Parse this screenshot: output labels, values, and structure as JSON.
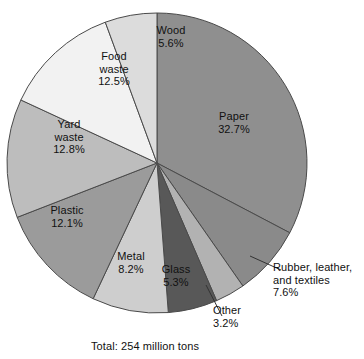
{
  "chart_data": {
    "type": "pie",
    "title": "",
    "subtitle": "",
    "caption": "Total: 254 million tons",
    "total_label": "Total: 254 million tons",
    "total_value": 254,
    "total_units": "million tons",
    "units": "percent",
    "start_angle_deg": 0,
    "direction": "clockwise",
    "legend": "none",
    "grid": false,
    "categories": [
      "Paper",
      "Rubber, leather, and textiles",
      "Other",
      "Glass",
      "Metal",
      "Plastic",
      "Yard waste",
      "Food waste",
      "Wood"
    ],
    "values": [
      32.7,
      7.6,
      3.2,
      5.3,
      8.2,
      12.1,
      12.8,
      12.5,
      5.6
    ],
    "slices": [
      {
        "key": "paper",
        "name": "Paper",
        "value": 32.7,
        "value_label": "32.7%",
        "color": "#8f8f8f",
        "label_placement": "inside",
        "label_lines": [
          "Paper",
          "32.7%"
        ]
      },
      {
        "key": "rubber",
        "name": "Rubber, leather, and textiles",
        "value": 7.6,
        "value_label": "7.6%",
        "color": "#8a8a8a",
        "label_placement": "callout",
        "label_lines": [
          "Rubber, leather,",
          "and textiles",
          "7.6%"
        ]
      },
      {
        "key": "other",
        "name": "Other",
        "value": 3.2,
        "value_label": "3.2%",
        "color": "#b2b2b2",
        "label_placement": "callout",
        "label_lines": [
          "Other",
          "3.2%"
        ]
      },
      {
        "key": "glass",
        "name": "Glass",
        "value": 5.3,
        "value_label": "5.3%",
        "color": "#585858",
        "label_placement": "inside",
        "label_lines": [
          "Glass",
          "5.3%"
        ]
      },
      {
        "key": "metal",
        "name": "Metal",
        "value": 8.2,
        "value_label": "8.2%",
        "color": "#cecece",
        "label_placement": "inside",
        "label_lines": [
          "Metal",
          "8.2%"
        ]
      },
      {
        "key": "plastic",
        "name": "Plastic",
        "value": 12.1,
        "value_label": "12.1%",
        "color": "#9b9b9b",
        "label_placement": "inside",
        "label_lines": [
          "Plastic",
          "12.1%"
        ]
      },
      {
        "key": "yard-waste",
        "name": "Yard waste",
        "value": 12.8,
        "value_label": "12.8%",
        "color": "#bdbdbd",
        "label_placement": "inside",
        "label_lines": [
          "Yard",
          "waste",
          "12.8%"
        ]
      },
      {
        "key": "food-waste",
        "name": "Food waste",
        "value": 12.5,
        "value_label": "12.5%",
        "color": "#f2f2f2",
        "label_placement": "inside",
        "label_lines": [
          "Food",
          "waste",
          "12.5%"
        ]
      },
      {
        "key": "wood",
        "name": "Wood",
        "value": 5.6,
        "value_label": "5.6%",
        "color": "#dcdcdc",
        "label_placement": "inside",
        "label_lines": [
          "Wood",
          "5.6%"
        ]
      }
    ]
  },
  "labels": {
    "paper": "Paper\n32.7%",
    "wood": "Wood\n5.6%",
    "food_waste": "Food\nwaste\n12.5%",
    "yard_waste": "Yard\nwaste\n12.8%",
    "plastic": "Plastic\n12.1%",
    "metal": "Metal\n8.2%",
    "glass": "Glass\n5.3%",
    "other": "Other\n3.2%",
    "rubber": "Rubber, leather,\nand textiles\n7.6%"
  },
  "caption": {
    "total": "Total: 254 million tons"
  },
  "colors": {
    "background": "#ffffff",
    "outline": "#4a4a4a",
    "text": "#111111",
    "leader_line": "#333333"
  }
}
